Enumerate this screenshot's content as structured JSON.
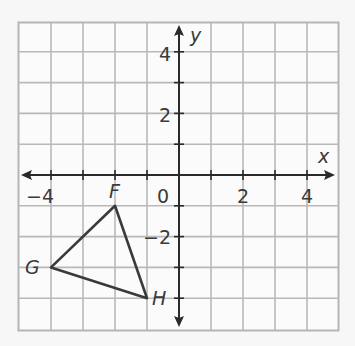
{
  "chart_data": {
    "type": "scatter",
    "title": "",
    "xlabel": "x",
    "ylabel": "y",
    "xlim": [
      -5,
      5
    ],
    "ylim": [
      -5,
      5
    ],
    "grid": true,
    "x_tick_labels": [
      "−4",
      "0",
      "2",
      "4"
    ],
    "y_tick_labels": [
      "4",
      "2",
      "−2"
    ],
    "shape": "triangle",
    "points": [
      {
        "label": "F",
        "x": -2,
        "y": -1
      },
      {
        "label": "G",
        "x": -4,
        "y": -3
      },
      {
        "label": "H",
        "x": -1,
        "y": -4
      }
    ]
  },
  "colors": {
    "grid": "#b9b9b9",
    "axis": "#2a2a2a",
    "shape": "#3a3a3a",
    "background": "#f7f7f7"
  }
}
